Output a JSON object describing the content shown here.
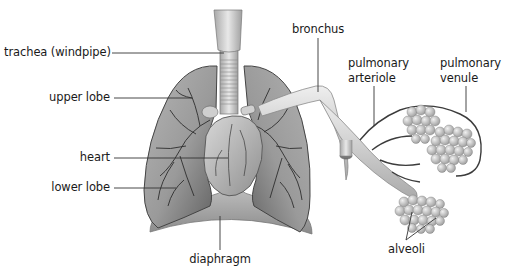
{
  "labels": {
    "trachea": "trachea (windpipe)",
    "upper_lobe": "upper lobe",
    "heart": "heart",
    "lower_lobe": "lower lobe",
    "diaphragm": "diaphragm",
    "bronchus": "bronchus",
    "pulmonary_arteriole_1": "pulmonary",
    "pulmonary_arteriole_2": "arteriole",
    "pulmonary_venule_1": "pulmonary",
    "pulmonary_venule_2": "venule",
    "alveoli": "alveoli"
  },
  "colors": {
    "background": "#ffffff",
    "lung_dark": "#6e6e6e",
    "lung_mid": "#9a9a9a",
    "lung_light": "#c8c8c8",
    "heart": "#bdbdbd",
    "trachea": "#d6d6d6",
    "bronchus": "#dedede",
    "alveoli": "#cfcfcf",
    "leader_line": "#333333",
    "text": "#1a1a1a"
  }
}
